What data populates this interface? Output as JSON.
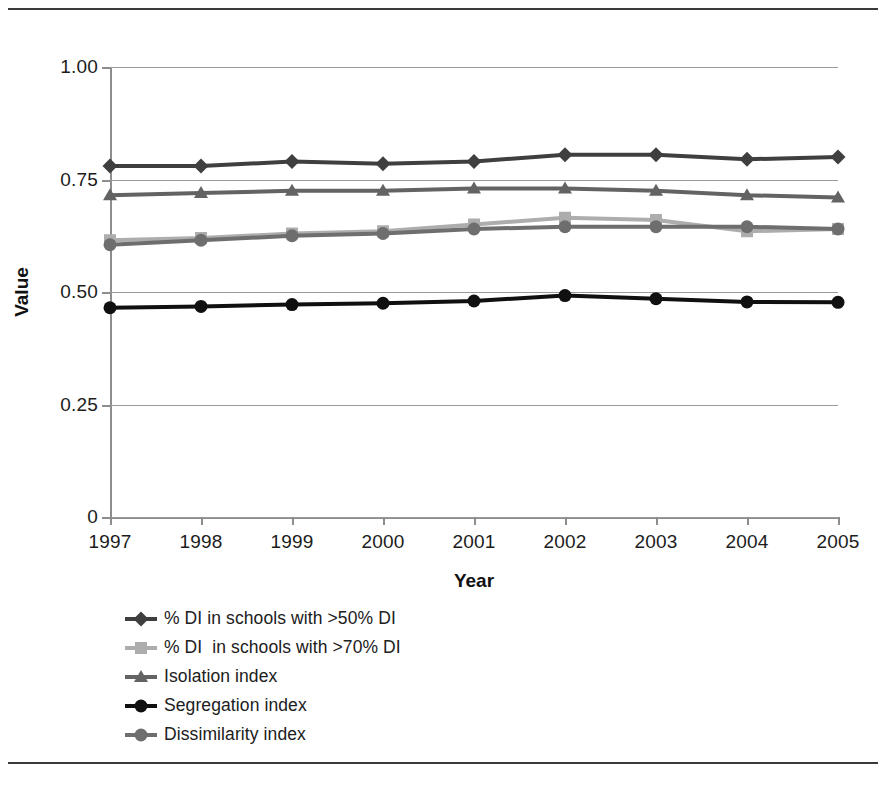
{
  "chart_data": {
    "type": "line",
    "title": "",
    "xlabel": "Year",
    "ylabel": "Value",
    "categories": [
      "1997",
      "1998",
      "1999",
      "2000",
      "2001",
      "2002",
      "2003",
      "2004",
      "2005"
    ],
    "x": [
      1997,
      1998,
      1999,
      2000,
      2001,
      2002,
      2003,
      2004,
      2005
    ],
    "ylim": [
      0,
      1.0
    ],
    "yticks": [
      0,
      0.25,
      0.5,
      0.75,
      1.0
    ],
    "ytick_labels": [
      "0",
      "0.25",
      "0.50",
      "0.75",
      "1.00"
    ],
    "grid": true,
    "legend_position": "below-left",
    "series": [
      {
        "name": "% DI in schools with >50% DI",
        "marker": "diamond",
        "color": "#3f3f3f",
        "values": [
          0.78,
          0.78,
          0.79,
          0.785,
          0.79,
          0.805,
          0.805,
          0.795,
          0.8
        ]
      },
      {
        "name": "% DI  in schools with >70% DI",
        "marker": "square",
        "color": "#adadad",
        "values": [
          0.615,
          0.62,
          0.63,
          0.635,
          0.65,
          0.665,
          0.66,
          0.635,
          0.64
        ]
      },
      {
        "name": "Isolation index",
        "marker": "triangle",
        "color": "#636363",
        "values": [
          0.715,
          0.72,
          0.725,
          0.725,
          0.73,
          0.73,
          0.725,
          0.715,
          0.71
        ]
      },
      {
        "name": "Segregation index",
        "marker": "circle",
        "color": "#101010",
        "values": [
          0.465,
          0.468,
          0.472,
          0.475,
          0.48,
          0.492,
          0.485,
          0.478,
          0.477
        ]
      },
      {
        "name": "Dissimilarity index",
        "marker": "circle",
        "color": "#6e6e6e",
        "values": [
          0.605,
          0.615,
          0.625,
          0.63,
          0.64,
          0.645,
          0.645,
          0.645,
          0.64
        ]
      }
    ]
  },
  "axes": {
    "y_title": "Value",
    "x_title": "Year"
  },
  "colors": {
    "axis": "#8d8d8d",
    "grid": "#9a9a9a",
    "rule": "#3a3a3a",
    "text": "#1c1c1c"
  }
}
